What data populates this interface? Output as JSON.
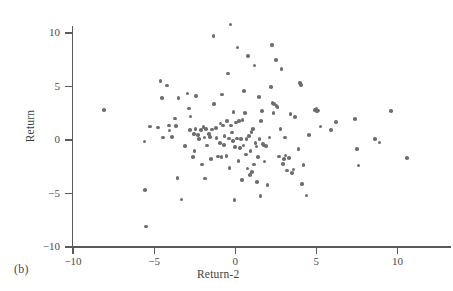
{
  "panel": {
    "label": "(b)"
  },
  "style": {
    "point_color": "#6e6e6e",
    "axis_color": "#5a5a5a",
    "background": "#ffffff"
  },
  "chart_data": {
    "type": "scatter",
    "title": "",
    "panel_label": "(b)",
    "xlabel": "Return-2",
    "ylabel": "Return",
    "xlim": [
      -10,
      13.3
    ],
    "ylim": [
      -10,
      10
    ],
    "xticks": [
      -10,
      -5,
      0,
      5,
      10
    ],
    "yticks": [
      -10,
      -5,
      0,
      5,
      10
    ],
    "xticklabels": [
      "−10",
      "−5",
      "0",
      "5",
      "10"
    ],
    "yticklabels": [
      "−10",
      "−5",
      "0",
      "5",
      "10"
    ],
    "grid": false,
    "legend": null,
    "marker": "circle",
    "n_points": 145,
    "series": [
      {
        "name": "Return vs Return-2",
        "color": "#6e6e6e",
        "points": [
          [
            -8.1,
            2.8
          ],
          [
            -5.6,
            -0.15
          ],
          [
            -5.55,
            -4.65
          ],
          [
            -5.5,
            -8.1
          ],
          [
            -5.25,
            1.25
          ],
          [
            -4.75,
            1.15
          ],
          [
            -4.6,
            5.5
          ],
          [
            -4.5,
            3.95
          ],
          [
            -4.45,
            0.25
          ],
          [
            -4.2,
            5.1
          ],
          [
            -4.1,
            1.35
          ],
          [
            -4.05,
            0.9
          ],
          [
            -3.9,
            0.3
          ],
          [
            -3.7,
            2.0
          ],
          [
            -3.65,
            1.3
          ],
          [
            -3.55,
            -3.55
          ],
          [
            -3.5,
            3.9
          ],
          [
            -3.3,
            -5.55
          ],
          [
            -3.1,
            -0.55
          ],
          [
            -2.95,
            4.35
          ],
          [
            -2.85,
            2.95
          ],
          [
            -2.8,
            0.95
          ],
          [
            -2.75,
            2.2
          ],
          [
            -2.6,
            -1.6
          ],
          [
            -2.55,
            0.55
          ],
          [
            -2.5,
            -1.05
          ],
          [
            -2.45,
            1.05
          ],
          [
            -2.4,
            4.1
          ],
          [
            -2.3,
            0.45
          ],
          [
            -2.25,
            0.1
          ],
          [
            -2.1,
            0.95
          ],
          [
            -2.05,
            -2.3
          ],
          [
            -1.95,
            1.2
          ],
          [
            -1.9,
            0.25
          ],
          [
            -1.85,
            -3.6
          ],
          [
            -1.8,
            1.05
          ],
          [
            -1.75,
            -0.5
          ],
          [
            -1.6,
            0.55
          ],
          [
            -1.55,
            0.3
          ],
          [
            -1.5,
            -1.75
          ],
          [
            -1.45,
            1.0
          ],
          [
            -1.35,
            9.7
          ],
          [
            -1.3,
            3.35
          ],
          [
            -1.2,
            1.1
          ],
          [
            -1.15,
            0.2
          ],
          [
            -1.05,
            -1.55
          ],
          [
            -0.95,
            -0.3
          ],
          [
            -0.9,
            1.55
          ],
          [
            -0.85,
            -1.6
          ],
          [
            -0.8,
            4.25
          ],
          [
            -0.75,
            1.35
          ],
          [
            -0.7,
            -0.45
          ],
          [
            -0.65,
            0.35
          ],
          [
            -0.55,
            -1.5
          ],
          [
            -0.5,
            1.75
          ],
          [
            -0.45,
            6.2
          ],
          [
            -0.4,
            0.15
          ],
          [
            -0.35,
            -2.6
          ],
          [
            -0.3,
            10.8
          ],
          [
            -0.25,
            1.35
          ],
          [
            -0.2,
            0.7
          ],
          [
            -0.15,
            -0.1
          ],
          [
            -0.1,
            2.6
          ],
          [
            -0.05,
            -5.6
          ],
          [
            0.0,
            -0.65
          ],
          [
            0.05,
            1.65
          ],
          [
            0.1,
            0.15
          ],
          [
            0.15,
            8.65
          ],
          [
            0.2,
            -1.95
          ],
          [
            0.25,
            1.8
          ],
          [
            0.3,
            -0.75
          ],
          [
            0.35,
            0.1
          ],
          [
            0.4,
            -3.75
          ],
          [
            0.45,
            1.85
          ],
          [
            0.5,
            -0.5
          ],
          [
            0.55,
            4.6
          ],
          [
            0.6,
            2.55
          ],
          [
            0.65,
            -1.35
          ],
          [
            0.7,
            0.1
          ],
          [
            0.75,
            -2.65
          ],
          [
            0.8,
            7.85
          ],
          [
            0.85,
            0.35
          ],
          [
            0.9,
            -3.25
          ],
          [
            0.95,
            -1.05
          ],
          [
            1.0,
            0.75
          ],
          [
            1.05,
            -3.0
          ],
          [
            1.1,
            1.05
          ],
          [
            1.15,
            -2.3
          ],
          [
            1.2,
            6.95
          ],
          [
            1.25,
            -0.3
          ],
          [
            1.3,
            -0.6
          ],
          [
            1.35,
            -3.9
          ],
          [
            1.4,
            -1.6
          ],
          [
            1.45,
            4.0
          ],
          [
            1.5,
            0.1
          ],
          [
            1.55,
            -5.25
          ],
          [
            1.6,
            1.75
          ],
          [
            1.65,
            2.7
          ],
          [
            1.7,
            -0.35
          ],
          [
            1.75,
            -0.5
          ],
          [
            1.8,
            -2.0
          ],
          [
            1.9,
            -0.55
          ],
          [
            2.0,
            -4.2
          ],
          [
            2.1,
            0.25
          ],
          [
            2.2,
            4.95
          ],
          [
            2.25,
            8.9
          ],
          [
            2.3,
            3.45
          ],
          [
            2.35,
            2.55
          ],
          [
            2.4,
            3.35
          ],
          [
            2.5,
            7.5
          ],
          [
            2.55,
            3.15
          ],
          [
            2.6,
            3.1
          ],
          [
            2.7,
            -1.55
          ],
          [
            2.8,
            1.05
          ],
          [
            2.85,
            6.65
          ],
          [
            2.95,
            -2.25
          ],
          [
            3.0,
            -1.8
          ],
          [
            3.05,
            0.25
          ],
          [
            3.1,
            -1.45
          ],
          [
            3.2,
            -2.85
          ],
          [
            3.3,
            -1.7
          ],
          [
            3.4,
            2.45
          ],
          [
            3.5,
            -3.1
          ],
          [
            3.6,
            -2.75
          ],
          [
            3.7,
            2.15
          ],
          [
            3.9,
            -0.85
          ],
          [
            4.0,
            5.35
          ],
          [
            4.05,
            5.15
          ],
          [
            4.1,
            -4.1
          ],
          [
            4.2,
            -2.35
          ],
          [
            4.4,
            -5.2
          ],
          [
            4.55,
            0.45
          ],
          [
            4.9,
            2.8
          ],
          [
            5.0,
            2.9
          ],
          [
            5.05,
            2.65
          ],
          [
            5.1,
            2.75
          ],
          [
            5.25,
            1.25
          ],
          [
            5.9,
            0.95
          ],
          [
            6.2,
            1.7
          ],
          [
            7.4,
            1.95
          ],
          [
            7.5,
            -0.85
          ],
          [
            7.6,
            -2.4
          ],
          [
            8.6,
            0.1
          ],
          [
            8.9,
            -0.25
          ],
          [
            9.6,
            2.7
          ],
          [
            10.6,
            -1.7
          ]
        ]
      }
    ]
  }
}
